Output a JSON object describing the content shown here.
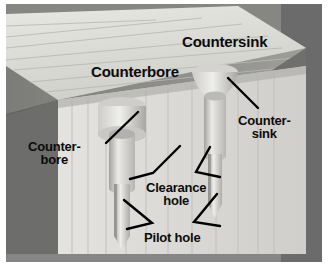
{
  "figure": {
    "background_color": "#8f8f8f",
    "border_color": "#ffffff"
  },
  "labels": {
    "countersink_top": "Countersink",
    "counterbore_top": "Counterbore",
    "countersink_side": "Counter-\nsink",
    "counterbore_side": "Counter-\nbore",
    "clearance_hole": "Clearance\nhole",
    "pilot_hole": "Pilot hole"
  },
  "colors": {
    "text": "#0b0b0b",
    "leader_line": "#000000",
    "wood_top_face": "#dcdcd8",
    "wood_top_edge": "#c4c4c0",
    "wood_front_face": "#8a8a87",
    "wood_lower_face": "#dedddb",
    "wood_lower_dark": "#6d6d6c",
    "hole_fill": "#e6e5e2",
    "hole_shade": "#a9a8a5",
    "grain_line": "#b6b6b2",
    "backdrop": "#8f8f8f",
    "backdrop_dark": "#6b6b6b"
  },
  "features": [
    {
      "name": "counterbore",
      "label": "Counterbore",
      "shape": "flat-bottom cylindrical recess",
      "side": "left"
    },
    {
      "name": "countersink",
      "label": "Countersink",
      "shape": "conical flared recess",
      "side": "right"
    },
    {
      "name": "clearance-hole",
      "label": "Clearance hole",
      "shape": "straight through hole in upper board"
    },
    {
      "name": "pilot-hole",
      "label": "Pilot hole",
      "shape": "narrow pointed hole in lower board"
    }
  ]
}
